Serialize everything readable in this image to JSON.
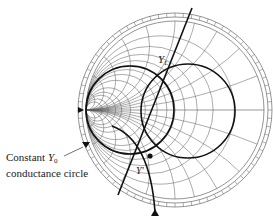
{
  "diagram": {
    "type": "admittance Smith chart",
    "annotations": {
      "callout_line1_text": "Constant ",
      "callout_line1_symbol": "Y",
      "callout_line1_subscript": "0",
      "callout_line2": "conductance circle",
      "load_admittance_symbol": "Y",
      "load_admittance_subscript": "L",
      "point_label": "Y'"
    },
    "markers": {
      "left_edge_triangle": "▼",
      "bottom_triangle": "▲"
    },
    "colors": {
      "grid": "#555555",
      "emphasis": "#111111",
      "background": "#ffffff"
    },
    "geometry": {
      "center": [
        175,
        110
      ],
      "outer_radius": 97
    }
  }
}
